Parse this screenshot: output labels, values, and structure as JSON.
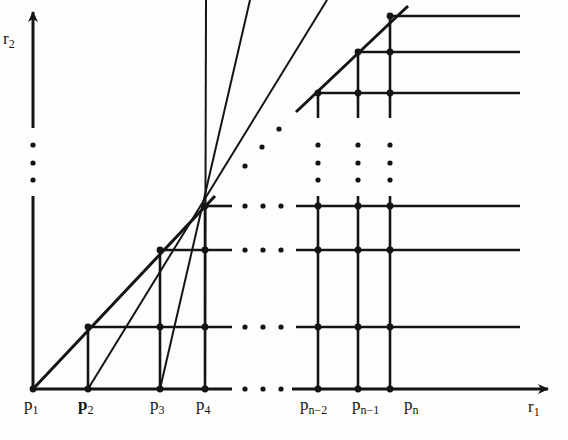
{
  "figure": {
    "kind": "lattice-staircase-diagram",
    "background_color": "#fdfdfb",
    "ink_color": "#141414",
    "axes": {
      "x": {
        "label": "r",
        "label_sub": "1",
        "name": "r_1",
        "origin_px": [
          33,
          389
        ],
        "end_px": [
          548,
          389
        ],
        "arrow": true,
        "break_dots": 3
      },
      "y": {
        "label": "r",
        "label_sub": "2",
        "name": "r_2",
        "origin_px": [
          33,
          389
        ],
        "end_px": [
          33,
          12
        ],
        "arrow": true,
        "break_dots": 3
      }
    },
    "point_labels": [
      {
        "base": "p",
        "sub": "1",
        "text": "p1",
        "x": 24,
        "y": 396
      },
      {
        "base": "p",
        "sub": "2",
        "text": "p2",
        "x": 78,
        "y": 396
      },
      {
        "base": "p",
        "sub": "3",
        "text": "p3",
        "x": 150,
        "y": 396
      },
      {
        "base": "p",
        "sub": "4",
        "text": "p4",
        "x": 196,
        "y": 396
      },
      {
        "base": "p",
        "sub": "n-2",
        "text": "pn-2",
        "x": 300,
        "y": 396
      },
      {
        "base": "p",
        "sub": "n-1",
        "text": "pn-1",
        "x": 352,
        "y": 396
      },
      {
        "base": "p",
        "sub": "n",
        "text": "pn",
        "x": 404,
        "y": 396
      }
    ],
    "axis_labels": [
      {
        "base": "r",
        "sub": "2",
        "text": "r2",
        "x": 3,
        "y": 30
      },
      {
        "base": "r",
        "sub": "1",
        "text": "r1",
        "x": 528,
        "y": 398
      }
    ],
    "columns_px": [
      33,
      88,
      160,
      205,
      318,
      358,
      390
    ],
    "rows_px": [
      16,
      52,
      93,
      206,
      250,
      327,
      389
    ],
    "diagonal_segments": [
      {
        "from": [
          33,
          389
        ],
        "to": [
          215,
          196
        ]
      },
      {
        "from": [
          296,
          112
        ],
        "to": [
          408,
          6
        ]
      }
    ],
    "dot_rows_px": [
      206,
      250,
      327,
      389
    ],
    "dot_row_x_px": [
      245,
      263,
      281
    ],
    "dot_col_x_px": [
      33,
      318,
      358,
      390
    ],
    "dot_col_y_px": [
      145,
      163,
      180
    ],
    "diagonal_dots_px": [
      [
        245,
        166
      ],
      [
        262,
        147
      ],
      [
        279,
        129
      ]
    ],
    "node_radius_px": 3.4
  },
  "chart_data": {
    "type": "scatter",
    "title": "",
    "xlabel": "r_1",
    "ylabel": "r_2",
    "categories": [
      "p1",
      "p2",
      "p3",
      "p4",
      "p_n-2",
      "p_n-1",
      "p_n"
    ],
    "x": [
      33,
      88,
      160,
      205,
      318,
      358,
      390
    ],
    "y": [
      389,
      327,
      250,
      206,
      93,
      52,
      16
    ],
    "grid": true,
    "legend": "none"
  }
}
